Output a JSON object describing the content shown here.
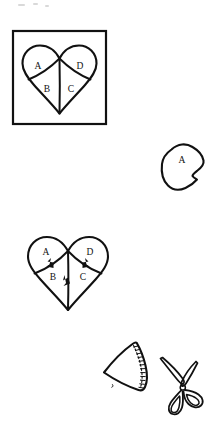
{
  "document": {
    "title": "Heart Patchwork Sewing Diagram",
    "background_color": "#ffffff",
    "ink_color": "#111111",
    "width": 223,
    "height": 435
  },
  "panels": [
    {
      "id": "panel-1",
      "name": "framed-heart-pattern",
      "caption": "",
      "has_frame": true,
      "piece_labels": [
        "A",
        "B",
        "C",
        "D"
      ]
    },
    {
      "id": "panel-2",
      "name": "cut-piece-a",
      "caption": "",
      "has_frame": false,
      "piece_labels": [
        "A"
      ]
    },
    {
      "id": "panel-3",
      "name": "heart-with-seam-arrows",
      "caption": "",
      "has_frame": false,
      "piece_labels": [
        "A",
        "B",
        "C",
        "D"
      ],
      "arrow_count": 3
    },
    {
      "id": "panel-4",
      "name": "stitched-piece-and-scissors",
      "caption": "",
      "has_frame": false,
      "piece_labels": [],
      "stitch_style": "dashed"
    }
  ],
  "labels": {
    "panel1": {
      "a": "A",
      "b": "B",
      "c": "C",
      "d": "D"
    },
    "panel2": {
      "a": "A"
    },
    "panel3": {
      "a": "A",
      "b": "B",
      "c": "C",
      "d": "D"
    }
  },
  "colors": {
    "ink": "#111111",
    "paper": "#ffffff",
    "speck": "#d9d9d9"
  }
}
